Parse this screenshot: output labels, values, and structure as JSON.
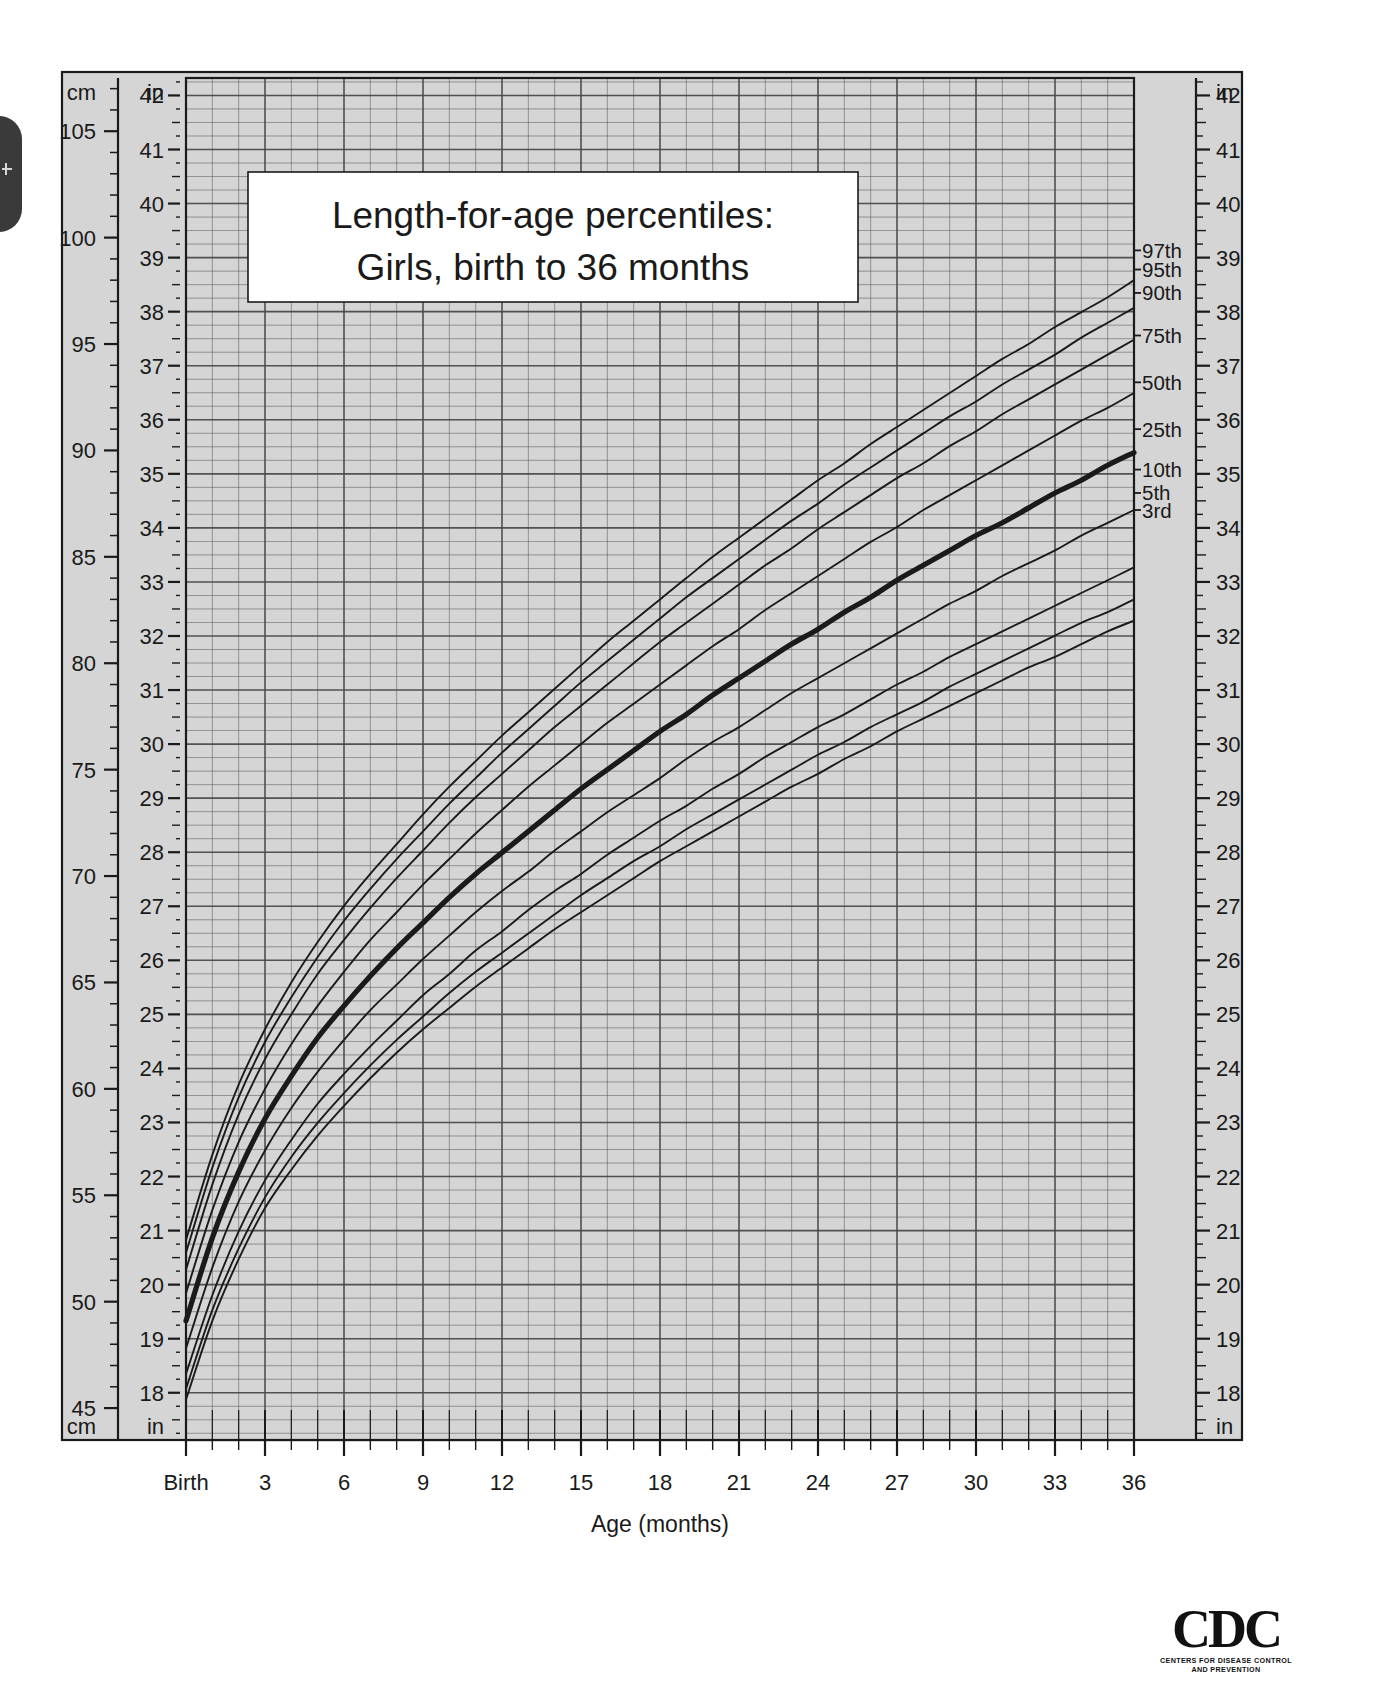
{
  "page": {
    "title_line1": "Length-for-age percentiles:",
    "title_line2": "Girls, birth to 36 months",
    "background": "#ffffff",
    "plot_background": "#d5d5d5",
    "line_color": "#1a1a1a"
  },
  "axes": {
    "x": {
      "label": "Age (months)",
      "ticks": [
        "Birth",
        "3",
        "6",
        "9",
        "12",
        "15",
        "18",
        "21",
        "24",
        "27",
        "30",
        "33",
        "36"
      ],
      "tick_values": [
        0,
        3,
        6,
        9,
        12,
        15,
        18,
        21,
        24,
        27,
        30,
        33,
        36
      ],
      "range": [
        0,
        36
      ],
      "minor_step_months": 1
    },
    "y_left_cm": {
      "unit": "cm",
      "unit_top": "cm",
      "unit_bottom": "cm",
      "ticks": [
        "105",
        "100",
        "95",
        "90",
        "85",
        "80",
        "75",
        "70",
        "65",
        "60",
        "55",
        "50",
        "45"
      ],
      "tick_values": [
        105,
        100,
        95,
        90,
        85,
        80,
        75,
        70,
        65,
        60,
        55,
        50,
        45
      ],
      "minor_step_cm": 1
    },
    "y_left_in": {
      "unit": "in",
      "unit_top": "in",
      "unit_bottom": "in",
      "ticks": [
        "42",
        "41",
        "40",
        "39",
        "38",
        "37",
        "36",
        "35",
        "34",
        "33",
        "32",
        "31",
        "30",
        "29",
        "28",
        "27",
        "26",
        "25",
        "24",
        "23",
        "22",
        "21",
        "20",
        "19",
        "18",
        "17"
      ],
      "tick_values": [
        42,
        41,
        40,
        39,
        38,
        37,
        36,
        35,
        34,
        33,
        32,
        31,
        30,
        29,
        28,
        27,
        26,
        25,
        24,
        23,
        22,
        21,
        20,
        19,
        18,
        17
      ],
      "minor_step_in": 0.25
    },
    "y_right_in": {
      "unit": "in",
      "unit_top": "in",
      "unit_bottom": "in",
      "ticks": [
        "42",
        "41",
        "40",
        "39",
        "38",
        "37",
        "36",
        "35",
        "34",
        "33",
        "32",
        "31",
        "30",
        "29",
        "28",
        "27",
        "26",
        "25",
        "24",
        "23",
        "22",
        "21",
        "20",
        "19",
        "18",
        "17"
      ],
      "tick_values": [
        42,
        41,
        40,
        39,
        38,
        37,
        36,
        35,
        34,
        33,
        32,
        31,
        30,
        29,
        28,
        27,
        26,
        25,
        24,
        23,
        22,
        21,
        20,
        19,
        18,
        17
      ]
    }
  },
  "percentile_labels": [
    {
      "name": "97th",
      "y_cm": 99.4
    },
    {
      "name": "95th",
      "y_cm": 98.5
    },
    {
      "name": "90th",
      "y_cm": 97.4
    },
    {
      "name": "75th",
      "y_cm": 95.4
    },
    {
      "name": "50th",
      "y_cm": 93.2
    },
    {
      "name": "25th",
      "y_cm": 91.0
    },
    {
      "name": "10th",
      "y_cm": 89.1
    },
    {
      "name": "5th",
      "y_cm": 88.0
    },
    {
      "name": "3rd",
      "y_cm": 87.2
    }
  ],
  "logo": {
    "word": "CDC",
    "sub_line1": "CENTERS FOR DISEASE CONTROL",
    "sub_line2": "AND PREVENTION"
  },
  "chart_data": {
    "type": "line",
    "xlabel": "Age (months)",
    "ylabel": "Length (cm / in)",
    "xlim": [
      0,
      36
    ],
    "ylim_cm": [
      43.5,
      107.5
    ],
    "ylim_in": [
      17.0,
      42.3
    ],
    "grid": true,
    "legend": "inline-right-edge",
    "x": [
      0,
      1,
      2,
      3,
      4,
      5,
      6,
      7,
      8,
      9,
      10,
      11,
      12,
      13,
      14,
      15,
      16,
      17,
      18,
      19,
      20,
      21,
      22,
      23,
      24,
      25,
      26,
      27,
      28,
      29,
      30,
      31,
      32,
      33,
      34,
      35,
      36
    ],
    "series": [
      {
        "name": "97th",
        "emphasis": false,
        "values_cm": [
          52.9,
          56.9,
          60.2,
          62.8,
          65.0,
          66.9,
          68.6,
          70.1,
          71.5,
          72.9,
          74.2,
          75.4,
          76.6,
          77.7,
          78.8,
          79.9,
          81.0,
          82.0,
          83.0,
          84.0,
          85.0,
          85.9,
          86.8,
          87.7,
          88.6,
          89.4,
          90.3,
          91.1,
          91.9,
          92.7,
          93.5,
          94.3,
          95.0,
          95.8,
          96.5,
          97.2,
          98.0
        ]
      },
      {
        "name": "95th",
        "emphasis": false,
        "values_cm": [
          52.3,
          56.3,
          59.6,
          62.2,
          64.3,
          66.2,
          67.9,
          69.4,
          70.8,
          72.1,
          73.4,
          74.6,
          75.8,
          76.9,
          78.0,
          79.1,
          80.1,
          81.1,
          82.1,
          83.1,
          84.0,
          84.9,
          85.8,
          86.7,
          87.5,
          88.4,
          89.2,
          90.0,
          90.8,
          91.6,
          92.3,
          93.1,
          93.8,
          94.5,
          95.3,
          96.0,
          96.7
        ]
      },
      {
        "name": "90th",
        "emphasis": false,
        "values_cm": [
          51.5,
          55.5,
          58.8,
          61.4,
          63.5,
          65.4,
          67.0,
          68.5,
          69.9,
          71.2,
          72.5,
          73.7,
          74.8,
          75.9,
          77.0,
          78.0,
          79.0,
          80.0,
          81.0,
          81.9,
          82.8,
          83.7,
          84.6,
          85.4,
          86.3,
          87.1,
          87.9,
          88.7,
          89.4,
          90.2,
          90.9,
          91.7,
          92.4,
          93.1,
          93.8,
          94.5,
          95.2
        ]
      },
      {
        "name": "75th",
        "emphasis": false,
        "values_cm": [
          50.4,
          54.3,
          57.5,
          60.0,
          62.1,
          63.9,
          65.5,
          67.0,
          68.3,
          69.6,
          70.8,
          72.0,
          73.1,
          74.2,
          75.2,
          76.2,
          77.2,
          78.1,
          79.0,
          79.9,
          80.8,
          81.6,
          82.5,
          83.3,
          84.1,
          84.9,
          85.7,
          86.4,
          87.2,
          87.9,
          88.6,
          89.3,
          90.0,
          90.7,
          91.4,
          92.0,
          92.7
        ]
      },
      {
        "name": "50th",
        "emphasis": true,
        "values_cm": [
          49.1,
          53.0,
          56.1,
          58.6,
          60.6,
          62.4,
          63.9,
          65.3,
          66.6,
          67.8,
          69.0,
          70.1,
          71.1,
          72.1,
          73.1,
          74.1,
          75.0,
          75.9,
          76.8,
          77.6,
          78.5,
          79.3,
          80.1,
          80.9,
          81.6,
          82.4,
          83.1,
          83.9,
          84.6,
          85.3,
          86.0,
          86.6,
          87.3,
          88.0,
          88.6,
          89.3,
          89.9
        ]
      },
      {
        "name": "25th",
        "emphasis": false,
        "values_cm": [
          47.8,
          51.6,
          54.7,
          57.1,
          59.1,
          60.8,
          62.3,
          63.7,
          64.9,
          66.1,
          67.2,
          68.3,
          69.3,
          70.2,
          71.2,
          72.1,
          73.0,
          73.8,
          74.6,
          75.5,
          76.3,
          77.0,
          77.8,
          78.6,
          79.3,
          80.0,
          80.7,
          81.4,
          82.1,
          82.8,
          83.4,
          84.1,
          84.7,
          85.3,
          86.0,
          86.6,
          87.2
        ]
      },
      {
        "name": "10th",
        "emphasis": false,
        "values_cm": [
          46.6,
          50.3,
          53.3,
          55.7,
          57.6,
          59.3,
          60.7,
          62.0,
          63.2,
          64.4,
          65.4,
          66.5,
          67.4,
          68.4,
          69.3,
          70.1,
          71.0,
          71.8,
          72.6,
          73.3,
          74.1,
          74.8,
          75.6,
          76.3,
          77.0,
          77.6,
          78.3,
          79.0,
          79.6,
          80.3,
          80.9,
          81.5,
          82.1,
          82.7,
          83.3,
          83.9,
          84.5
        ]
      },
      {
        "name": "5th",
        "emphasis": false,
        "values_cm": [
          45.9,
          49.6,
          52.5,
          54.9,
          56.8,
          58.4,
          59.8,
          61.1,
          62.3,
          63.4,
          64.5,
          65.5,
          66.4,
          67.3,
          68.2,
          69.1,
          69.9,
          70.7,
          71.4,
          72.2,
          72.9,
          73.6,
          74.3,
          75.0,
          75.7,
          76.3,
          77.0,
          77.6,
          78.2,
          78.9,
          79.5,
          80.1,
          80.7,
          81.3,
          81.9,
          82.4,
          83.0
        ]
      },
      {
        "name": "3rd",
        "emphasis": false,
        "values_cm": [
          45.4,
          49.1,
          52.0,
          54.4,
          56.2,
          57.8,
          59.2,
          60.5,
          61.7,
          62.8,
          63.8,
          64.8,
          65.7,
          66.6,
          67.5,
          68.3,
          69.1,
          69.9,
          70.7,
          71.4,
          72.1,
          72.8,
          73.5,
          74.2,
          74.8,
          75.5,
          76.1,
          76.8,
          77.4,
          78.0,
          78.6,
          79.2,
          79.8,
          80.3,
          80.9,
          81.5,
          82.0
        ]
      }
    ]
  }
}
